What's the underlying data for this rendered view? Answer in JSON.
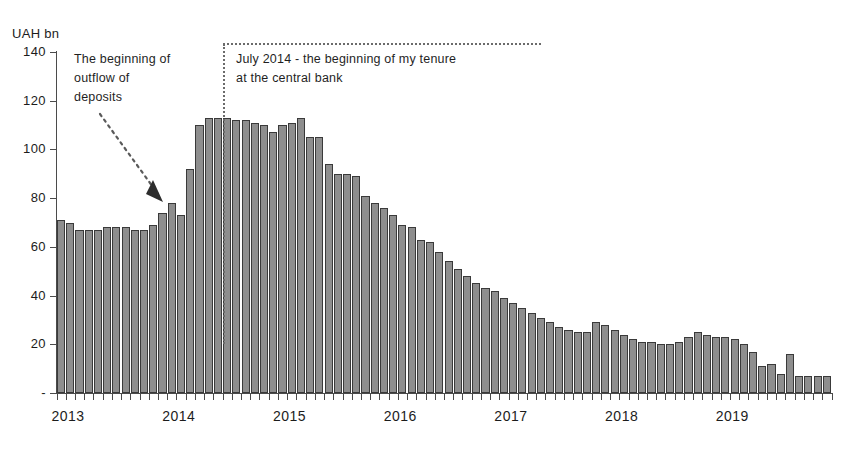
{
  "chart_data": {
    "type": "bar",
    "title": "",
    "ylabel": "UAH bn",
    "xlabel": "",
    "ylim": [
      0,
      140
    ],
    "grid": false,
    "legend": "none",
    "y_ticks": [
      "140",
      "120",
      "100",
      "80",
      "60",
      "40",
      "20",
      "-"
    ],
    "y_tick_values": [
      140,
      120,
      100,
      80,
      60,
      40,
      20,
      0
    ],
    "x_tick_labels": [
      "2013",
      "2014",
      "2015",
      "2016",
      "2017",
      "2018",
      "2019"
    ],
    "x_tick_years": [
      2013,
      2014,
      2015,
      2016,
      2017,
      2018,
      2019
    ],
    "frequency": "monthly",
    "categories": [
      "2013-01",
      "2013-02",
      "2013-03",
      "2013-04",
      "2013-05",
      "2013-06",
      "2013-07",
      "2013-08",
      "2013-09",
      "2013-10",
      "2013-11",
      "2013-12",
      "2014-01",
      "2014-02",
      "2014-03",
      "2014-04",
      "2014-05",
      "2014-06",
      "2014-07",
      "2014-08",
      "2014-09",
      "2014-10",
      "2014-11",
      "2014-12",
      "2015-01",
      "2015-02",
      "2015-03",
      "2015-04",
      "2015-05",
      "2015-06",
      "2015-07",
      "2015-08",
      "2015-09",
      "2015-10",
      "2015-11",
      "2015-12",
      "2016-01",
      "2016-02",
      "2016-03",
      "2016-04",
      "2016-05",
      "2016-06",
      "2016-07",
      "2016-08",
      "2016-09",
      "2016-10",
      "2016-11",
      "2016-12",
      "2017-01",
      "2017-02",
      "2017-03",
      "2017-04",
      "2017-05",
      "2017-06",
      "2017-07",
      "2017-08",
      "2017-09",
      "2017-10",
      "2017-11",
      "2017-12",
      "2018-01",
      "2018-02",
      "2018-03",
      "2018-04",
      "2018-05",
      "2018-06",
      "2018-07",
      "2018-08",
      "2018-09",
      "2018-10",
      "2018-11",
      "2018-12",
      "2019-01",
      "2019-02",
      "2019-03",
      "2019-04",
      "2019-05",
      "2019-06",
      "2019-07",
      "2019-08",
      "2019-09",
      "2019-10",
      "2019-11",
      "2019-12"
    ],
    "values": [
      71,
      70,
      67,
      67,
      67,
      68,
      68,
      68,
      67,
      67,
      69,
      74,
      78,
      73,
      92,
      110,
      113,
      113,
      113,
      112,
      112,
      111,
      110,
      107,
      110,
      111,
      113,
      105,
      105,
      94,
      90,
      90,
      89,
      81,
      78,
      76,
      73,
      69,
      68,
      63,
      62,
      58,
      54,
      51,
      48,
      45,
      43,
      42,
      39,
      37,
      35,
      33,
      31,
      29,
      27,
      26,
      25,
      25,
      29,
      28,
      26,
      24,
      22,
      21,
      21,
      20,
      20,
      21,
      23,
      25,
      24,
      23,
      23,
      22,
      20,
      17,
      11,
      12,
      8,
      16,
      7,
      7,
      7,
      7
    ],
    "bar_color": "#8e8e8e",
    "bar_edge_color": "#3a3a3a",
    "annotations": [
      {
        "name": "outflow",
        "text": "The beginning of\noutflow of\ndeposits",
        "kind": "dotted-arrow"
      },
      {
        "name": "tenure",
        "text": "July 2014 - the beginning of my tenure\nat the central bank",
        "kind": "dotted-vertical-line",
        "marker_x": "2014-07"
      }
    ]
  }
}
